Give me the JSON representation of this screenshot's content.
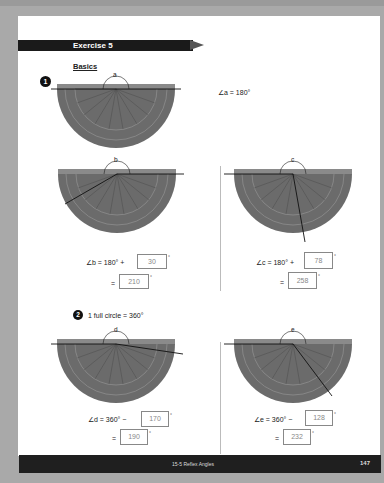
{
  "exercise": {
    "title": "Exercise 5",
    "section": "Basics"
  },
  "problem1": {
    "number": "1",
    "angle_a": {
      "label": "a",
      "statement": "∠a = 180°"
    },
    "angle_b": {
      "label": "b",
      "eq_prefix": "∠b = 180° +",
      "addend": "30",
      "result": "210",
      "deg": "°",
      "equals": "="
    },
    "angle_c": {
      "label": "c",
      "eq_prefix": "∠c = 180° +",
      "addend": "78",
      "result": "258",
      "deg": "°",
      "equals": "="
    }
  },
  "problem2": {
    "number": "2",
    "statement": "1 full circle = 360°",
    "angle_d": {
      "label": "d",
      "eq_prefix": "∠d = 360° −",
      "subtrahend": "170",
      "result": "190",
      "deg": "°",
      "equals": "="
    },
    "angle_e": {
      "label": "e",
      "eq_prefix": "∠e = 360° −",
      "subtrahend": "128",
      "result": "232",
      "deg": "°",
      "equals": "="
    }
  },
  "footer": {
    "lesson": "15-5 Reflex Angles",
    "page_number": "147"
  },
  "colors": {
    "protractor": "#6b6b6b",
    "banner": "#1a1a1a",
    "page": "#ffffff",
    "background": "#a9a9a9"
  }
}
